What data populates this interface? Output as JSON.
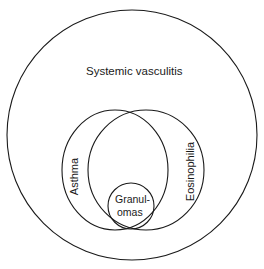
{
  "diagram": {
    "type": "venn",
    "sets": [
      {
        "id": "systemic-vasculitis",
        "label": "Systemic vasculitis"
      },
      {
        "id": "asthma",
        "label": "Asthma"
      },
      {
        "id": "eosinophilia",
        "label": "Eosinophilia"
      },
      {
        "id": "granulomas",
        "label_line1": "Granul-",
        "label_line2": "omas"
      }
    ],
    "stroke_color": "#1a1a1a",
    "background": "#ffffff"
  }
}
